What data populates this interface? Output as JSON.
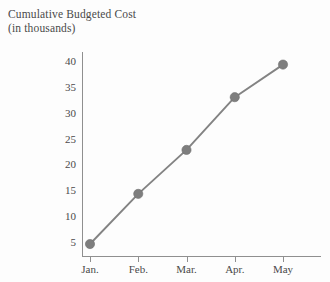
{
  "chart_data": {
    "type": "line",
    "title": "Cumulative Budgeted Cost",
    "subtitle": "(in thousands)",
    "xlabel": "",
    "ylabel": "",
    "categories": [
      "Jan.",
      "Feb.",
      "Mar.",
      "Apr.",
      "May"
    ],
    "values": [
      4.8,
      14.5,
      23.0,
      33.2,
      39.5
    ],
    "series": [
      {
        "name": "Cumulative Budgeted Cost",
        "values": [
          4.8,
          14.5,
          23.0,
          33.2,
          39.5
        ]
      }
    ],
    "yticks": [
      5,
      10,
      15,
      20,
      25,
      30,
      35,
      40
    ],
    "ytick_labels": [
      "5",
      "10",
      "15",
      "20",
      "25",
      "30",
      "35",
      "40"
    ],
    "xtick_labels": [
      "Jan.",
      "Feb.",
      "Mar.",
      "Apr.",
      "May"
    ],
    "ylim": [
      2.5,
      42.0
    ],
    "grid": false,
    "legend": "none",
    "marker": "circle",
    "colors": {
      "line": "#838383",
      "marker": "#7e7e7e",
      "axis": "#8f8f8f",
      "text": "#4a4a4a",
      "background": "#fdfdfd"
    }
  }
}
